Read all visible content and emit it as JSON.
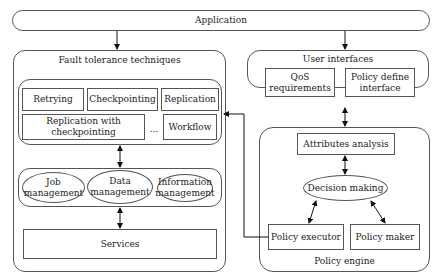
{
  "application": {
    "label": "Application"
  },
  "fault_tolerance": {
    "title": "Fault tolerance techniques",
    "techniques": {
      "retrying": "Retrying",
      "checkpointing": "Checkpointing",
      "replication": "Replication",
      "replication_with_checkpointing": "Replication with\ncheckpointing",
      "ellipsis": "...",
      "workflow": "Workflow"
    },
    "management": {
      "job": "Job\nmanagement",
      "data": "Data\nmanagement",
      "information": "Information\nmanagement"
    },
    "services": "Services"
  },
  "user_interfaces": {
    "title": "User interfaces",
    "qos": "QoS\nrequirements",
    "policy_define": "Policy define\ninterface"
  },
  "policy_engine": {
    "title": "Policy engine",
    "attributes_analysis": "Attributes analysis",
    "decision_making": "Decision making",
    "policy_executor": "Policy executor",
    "policy_maker": "Policy maker"
  }
}
